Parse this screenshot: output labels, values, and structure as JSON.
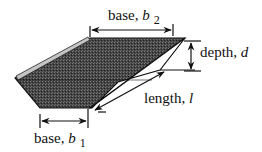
{
  "diagram": {
    "title": "",
    "colors": {
      "stroke": "#111111",
      "front_face_fill": "#3a3a3a",
      "highlight": "#bdbdbd",
      "side_face_fill": "#ffffff",
      "background": "#ffffff"
    },
    "labels": {
      "base_top": {
        "text": "base, ",
        "symbol": "b",
        "subscript": "2"
      },
      "base_bottom": {
        "text": "base, ",
        "symbol": "b",
        "subscript": "1"
      },
      "depth": {
        "text": "depth, ",
        "symbol": "d"
      },
      "length": {
        "text": "length, ",
        "symbol": "l"
      }
    },
    "dimensions": [
      {
        "name": "base_b2",
        "orientation": "horizontal",
        "from": [
          90,
          31
        ],
        "to": [
          185,
          31
        ]
      },
      {
        "name": "base_b1",
        "orientation": "horizontal",
        "from": [
          40,
          121
        ],
        "to": [
          90,
          121
        ]
      },
      {
        "name": "depth_d",
        "orientation": "vertical",
        "from": [
          196,
          42
        ],
        "to": [
          196,
          71
        ]
      },
      {
        "name": "length_l",
        "orientation": "diagonal",
        "from": [
          98,
          110
        ],
        "to": [
          180,
          69
        ]
      }
    ]
  }
}
